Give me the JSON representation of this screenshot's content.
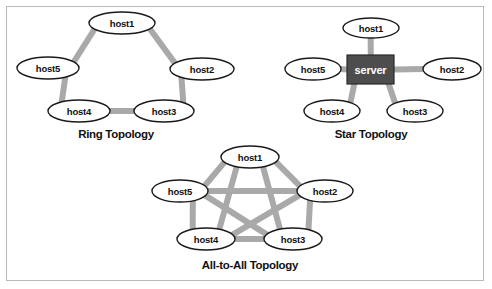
{
  "figure": {
    "background_color": "#ffffff",
    "border_color": "#b9b9b9",
    "edge_color": "#a9a9a9",
    "node_fill": "#ffffff",
    "node_stroke": "#1a1a1a",
    "server_fill": "#4d4d4d",
    "server_text_color": "#ffffff"
  },
  "diagrams": {
    "ring": {
      "caption": "Ring Topology",
      "caption_x": 116,
      "caption_y": 134,
      "nodes": [
        {
          "id": "host1",
          "label": "host1",
          "cx": 122,
          "cy": 23,
          "rx": 33,
          "ry": 11
        },
        {
          "id": "host2",
          "label": "host2",
          "cx": 202,
          "cy": 69,
          "rx": 32,
          "ry": 11
        },
        {
          "id": "host3",
          "label": "host3",
          "cx": 164,
          "cy": 111,
          "rx": 30,
          "ry": 11
        },
        {
          "id": "host4",
          "label": "host4",
          "cx": 79,
          "cy": 111,
          "rx": 31,
          "ry": 11
        },
        {
          "id": "host5",
          "label": "host5",
          "cx": 48,
          "cy": 68,
          "rx": 31,
          "ry": 11
        }
      ],
      "edges": [
        {
          "from": "host1",
          "to": "host2"
        },
        {
          "from": "host2",
          "to": "host3"
        },
        {
          "from": "host3",
          "to": "host4"
        },
        {
          "from": "host4",
          "to": "host5"
        },
        {
          "from": "host5",
          "to": "host1"
        }
      ]
    },
    "star": {
      "caption": "Star Topology",
      "caption_x": 371,
      "caption_y": 134,
      "center": {
        "id": "server",
        "label": "server",
        "x": 347,
        "y": 55,
        "width": 47,
        "height": 29
      },
      "nodes": [
        {
          "id": "host1",
          "label": "host1",
          "cx": 371,
          "cy": 28,
          "rx": 28,
          "ry": 10
        },
        {
          "id": "host2",
          "label": "host2",
          "cx": 452,
          "cy": 69,
          "rx": 29,
          "ry": 11
        },
        {
          "id": "host3",
          "label": "host3",
          "cx": 415,
          "cy": 111,
          "rx": 28,
          "ry": 11
        },
        {
          "id": "host4",
          "label": "host4",
          "cx": 332,
          "cy": 111,
          "rx": 28,
          "ry": 11
        },
        {
          "id": "host5",
          "label": "host5",
          "cx": 313,
          "cy": 69,
          "rx": 28,
          "ry": 11
        }
      ],
      "edges": [
        {
          "from": "server",
          "to": "host1"
        },
        {
          "from": "server",
          "to": "host2"
        },
        {
          "from": "server",
          "to": "host3"
        },
        {
          "from": "server",
          "to": "host4"
        },
        {
          "from": "server",
          "to": "host5"
        }
      ]
    },
    "all_to_all": {
      "caption": "All-to-All Topology",
      "caption_x": 250,
      "caption_y": 265,
      "nodes": [
        {
          "id": "host1",
          "label": "host1",
          "cx": 250,
          "cy": 157,
          "rx": 29,
          "ry": 11
        },
        {
          "id": "host2",
          "label": "host2",
          "cx": 325,
          "cy": 191,
          "rx": 28,
          "ry": 11
        },
        {
          "id": "host3",
          "label": "host3",
          "cx": 293,
          "cy": 239,
          "rx": 29,
          "ry": 11
        },
        {
          "id": "host4",
          "label": "host4",
          "cx": 206,
          "cy": 239,
          "rx": 29,
          "ry": 11
        },
        {
          "id": "host5",
          "label": "host5",
          "cx": 180,
          "cy": 191,
          "rx": 28,
          "ry": 11
        }
      ],
      "edges": [
        {
          "from": "host1",
          "to": "host2"
        },
        {
          "from": "host2",
          "to": "host3"
        },
        {
          "from": "host3",
          "to": "host4"
        },
        {
          "from": "host4",
          "to": "host5"
        },
        {
          "from": "host5",
          "to": "host1"
        },
        {
          "from": "host1",
          "to": "host3"
        },
        {
          "from": "host1",
          "to": "host4"
        },
        {
          "from": "host2",
          "to": "host4"
        },
        {
          "from": "host2",
          "to": "host5"
        },
        {
          "from": "host3",
          "to": "host5"
        }
      ]
    }
  }
}
